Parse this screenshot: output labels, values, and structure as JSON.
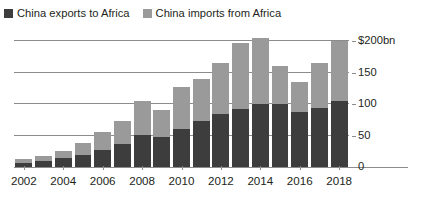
{
  "colors": {
    "exports": "#3d3d3d",
    "imports": "#9a9a9a",
    "grid": "#8c8c8c",
    "text": "#231f20",
    "background": "#ffffff"
  },
  "legend": {
    "position": "top-left",
    "entries": [
      {
        "label": "China exports to Africa",
        "color": "#3d3d3d",
        "swatch_name": "legend-swatch-exports"
      },
      {
        "label": "China imports from Africa",
        "color": "#9a9a9a",
        "swatch_name": "legend-swatch-imports"
      }
    ]
  },
  "axis": {
    "y_ticks": [
      {
        "label": "$200bn",
        "value": 200
      },
      {
        "label": "150",
        "value": 150
      },
      {
        "label": "100",
        "value": 100
      },
      {
        "label": "50",
        "value": 50
      },
      {
        "label": "0",
        "value": 0
      }
    ],
    "x_ticks": [
      {
        "label": "2002",
        "year": 2002
      },
      {
        "label": "2004",
        "year": 2004
      },
      {
        "label": "2006",
        "year": 2006
      },
      {
        "label": "2008",
        "year": 2008
      },
      {
        "label": "2010",
        "year": 2010
      },
      {
        "label": "2012",
        "year": 2012
      },
      {
        "label": "2014",
        "year": 2014
      },
      {
        "label": "2016",
        "year": 2016
      },
      {
        "label": "2018",
        "year": 2018
      }
    ]
  },
  "chart_data": {
    "type": "bar",
    "stacked": true,
    "title": "",
    "subtitle": "",
    "xlabel": "",
    "ylabel": "$200bn",
    "unit": "$bn",
    "ylim": [
      0,
      210
    ],
    "grid": true,
    "gridlines": [
      50,
      100,
      150,
      200
    ],
    "legend_position": "top-left",
    "categories": [
      2002,
      2003,
      2004,
      2005,
      2006,
      2007,
      2008,
      2009,
      2010,
      2011,
      2012,
      2013,
      2014,
      2015,
      2016,
      2017,
      2018
    ],
    "tick_labels": [
      "2002",
      "",
      "2004",
      "",
      "2006",
      "",
      "2008",
      "",
      "2010",
      "",
      "2012",
      "",
      "2014",
      "",
      "2016",
      "",
      "2018"
    ],
    "series": [
      {
        "name": "China exports to Africa",
        "color": "#3d3d3d",
        "values": [
          6,
          9,
          14,
          19,
          27,
          37,
          51,
          48,
          61,
          73,
          85,
          93,
          100,
          100,
          88,
          94,
          105
        ]
      },
      {
        "name": "China imports from Africa",
        "color": "#9a9a9a",
        "values": [
          6,
          8,
          12,
          19,
          29,
          36,
          54,
          42,
          66,
          67,
          80,
          105,
          106,
          60,
          47,
          71,
          95
        ]
      }
    ],
    "totals": [
      12,
      17,
      26,
      38,
      56,
      73,
      105,
      90,
      127,
      140,
      165,
      198,
      206,
      160,
      135,
      165,
      200
    ]
  }
}
